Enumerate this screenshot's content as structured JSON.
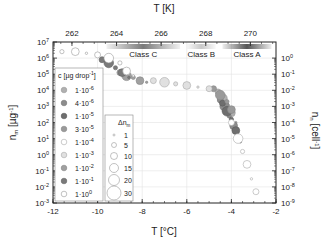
{
  "chart_data": {
    "type": "scatter",
    "title": "",
    "xlabel": "T [°C]",
    "xlabel_top": "T [K]",
    "ylabel_left": "n_m [µg^-1]",
    "ylabel_right": "n_n [cell^-1]",
    "xlim": [
      -12,
      -2
    ],
    "ylim_left_log10": [
      -3,
      7
    ],
    "ylim_right_log10": [
      -9,
      0
    ],
    "grid": true,
    "x_ticks": [
      -12,
      -10,
      -8,
      -6,
      -4,
      -2
    ],
    "x_tick_labels": [
      "-12",
      "-10",
      "-8",
      "-6",
      "-4",
      "-2"
    ],
    "top_ticks_K": [
      262,
      264,
      266,
      268,
      270
    ],
    "top_tick_labels": [
      "262",
      "264",
      "266",
      "268",
      "270"
    ],
    "y_left_ticks_log10": [
      7,
      6,
      5,
      4,
      3,
      2,
      1,
      0,
      -1,
      -2,
      -3
    ],
    "y_left_tick_labels": [
      "10^7",
      "10^6",
      "10^5",
      "10^4",
      "10^3",
      "10^2",
      "10^1",
      "10^0",
      "10^-1",
      "10^-2",
      "10^-3"
    ],
    "y_right_ticks_log10": [
      0,
      -1,
      -2,
      -3,
      -4,
      -5,
      -6,
      -7,
      -8,
      -9
    ],
    "y_right_tick_labels": [
      "10^0",
      "10^-1",
      "10^-2",
      "10^-3",
      "10^-4",
      "10^-5",
      "10^-6",
      "10^-7",
      "10^-8",
      "10^-9"
    ],
    "class_bands": [
      {
        "name": "Class C",
        "x_start": -9.6,
        "x_end": -6.3,
        "color": "#7a7a7a",
        "label_color": "#888888"
      },
      {
        "name": "Class B",
        "x_start": -6.0,
        "x_end": -4.7,
        "color": "#c8c8c8",
        "label_color": "#bbbbbb"
      },
      {
        "name": "Class A",
        "x_start": -4.4,
        "x_end": -2.2,
        "color": "#555555",
        "label_color": "#444444"
      }
    ],
    "legend_concentration": {
      "title": "c [µg drop^-1]",
      "position": "upper-left",
      "entries": [
        {
          "label": "1·10^-6",
          "fill": "#b0b0b0",
          "stroke": "#999999"
        },
        {
          "label": "4·10^-6",
          "fill": "#8c8c8c",
          "stroke": "#777777"
        },
        {
          "label": "1·10^-5",
          "fill": "#6e6e6e",
          "stroke": "#5a5a5a"
        },
        {
          "label": "3·10^-5",
          "fill": "#9a9a9a",
          "stroke": "#888888"
        },
        {
          "label": "1·10^-4",
          "fill": "#ffffff",
          "stroke": "#aaaaaa"
        },
        {
          "label": "1·10^-3",
          "fill": "#e0e0e0",
          "stroke": "#aaaaaa"
        },
        {
          "label": "1·10^-2",
          "fill": "#a0a0a0",
          "stroke": "#888888"
        },
        {
          "label": "1·10^-1",
          "fill": "#7a7a7a",
          "stroke": "#666666"
        },
        {
          "label": "1·10^0",
          "fill": "#ffffff",
          "stroke": "#999999"
        }
      ]
    },
    "legend_size": {
      "title": "Δn_m",
      "entries": [
        {
          "label": "1",
          "r": 1.0
        },
        {
          "label": "5",
          "r": 2.5
        },
        {
          "label": "10",
          "r": 3.5
        },
        {
          "label": "15",
          "r": 4.5
        },
        {
          "label": "20",
          "r": 5.5
        },
        {
          "label": "30",
          "r": 7.0
        }
      ]
    },
    "series": [
      {
        "name": "1·10^-6",
        "points": [
          [
            -4.6,
            3.9
          ],
          [
            -4.4,
            3.5
          ],
          [
            -4.2,
            3.1
          ],
          [
            -4.0,
            2.6
          ],
          [
            -3.8,
            2.0
          ]
        ]
      },
      {
        "name": "4·10^-6",
        "points": [
          [
            -4.5,
            3.4
          ],
          [
            -4.3,
            3.0
          ],
          [
            -4.1,
            2.4
          ],
          [
            -3.9,
            1.8
          ],
          [
            -3.7,
            1.2
          ]
        ]
      },
      {
        "name": "1·10^-5",
        "points": [
          [
            -4.4,
            3.2
          ],
          [
            -4.2,
            2.7
          ],
          [
            -4.0,
            2.2
          ],
          [
            -3.8,
            1.5
          ],
          [
            -3.6,
            0.8
          ]
        ]
      },
      {
        "name": "3·10^-5",
        "points": [
          [
            -4.8,
            4.1
          ],
          [
            -4.5,
            3.7
          ],
          [
            -4.2,
            3.3
          ],
          [
            -4.0,
            2.8
          ]
        ]
      },
      {
        "name": "1·10^-4",
        "points": [
          [
            -4.0,
            2.0
          ],
          [
            -3.7,
            1.0
          ],
          [
            -3.5,
            0.2
          ],
          [
            -3.3,
            -0.6
          ],
          [
            -3.1,
            -1.5
          ],
          [
            -2.9,
            -2.3
          ]
        ]
      },
      {
        "name": "1·10^-3",
        "points": [
          [
            -7.5,
            4.6
          ],
          [
            -7.0,
            4.5
          ],
          [
            -6.5,
            4.4
          ],
          [
            -6.0,
            4.3
          ],
          [
            -5.5,
            4.2
          ],
          [
            -5.0,
            4.1
          ]
        ]
      },
      {
        "name": "1·10^-2",
        "points": [
          [
            -9.0,
            5.1
          ],
          [
            -8.7,
            4.9
          ],
          [
            -8.4,
            4.8
          ],
          [
            -8.1,
            4.6
          ],
          [
            -7.8,
            4.5
          ]
        ]
      },
      {
        "name": "1·10^-1",
        "points": [
          [
            -9.8,
            5.9
          ],
          [
            -9.5,
            5.7
          ],
          [
            -9.2,
            5.4
          ],
          [
            -8.9,
            5.1
          ],
          [
            -8.6,
            4.8
          ]
        ]
      },
      {
        "name": "1·10^0",
        "points": [
          [
            -11.6,
            6.4
          ],
          [
            -11.0,
            6.4
          ],
          [
            -10.5,
            6.3
          ],
          [
            -10.0,
            6.2
          ],
          [
            -9.5,
            6.0
          ],
          [
            -9.0,
            5.7
          ],
          [
            -8.7,
            5.2
          ],
          [
            -8.4,
            4.9
          ]
        ]
      }
    ]
  },
  "frame": {
    "left": 53,
    "right": 276,
    "top": 42,
    "bottom": 203
  }
}
